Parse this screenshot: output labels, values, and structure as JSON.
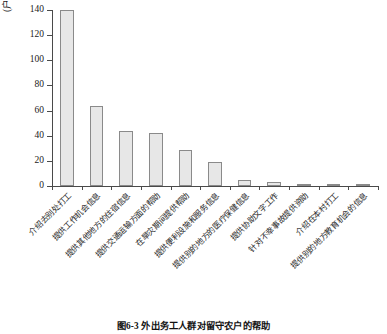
{
  "chart_data": {
    "type": "bar",
    "title": "图6-3 外出务工人群对留守农户的帮助",
    "xlabel": "",
    "ylabel": "(户)",
    "ylim": [
      0,
      140
    ],
    "yticks": [
      0,
      20,
      40,
      60,
      80,
      100,
      120,
      140
    ],
    "grid": false,
    "legend": null,
    "categories": [
      "介绍去别处打工",
      "提供工作机会信息",
      "提供其他地方的住宿信息",
      "提供交通运输方面的帮助",
      "在旱灾期间提供帮助",
      "提供便利设施和服务信息",
      "提供别的地方的医疗保健信息",
      "提供协助文字工作",
      "针对不幸事故提供资助",
      "介绍在本村打工",
      "提供别的地方教育机会的信息"
    ],
    "values": [
      140,
      64,
      44,
      42.5,
      29,
      19.5,
      5,
      3.5,
      2,
      2,
      2
    ]
  },
  "axis": {
    "unit_label": "(户)",
    "tick_labels": [
      "0",
      "20",
      "40",
      "60",
      "80",
      "100",
      "120",
      "140"
    ]
  },
  "caption": {
    "text": "图6-3 外出务工人群对留守农户的帮助"
  },
  "style": {
    "bar_fill": "#e7e7e7",
    "bar_stroke": "#8a8a8a",
    "axis_color": "#4a4a4a",
    "text_color": "#1a1a1a",
    "background": "#ffffff"
  }
}
